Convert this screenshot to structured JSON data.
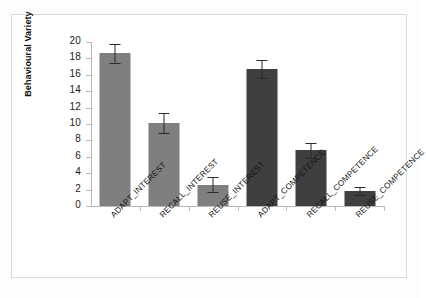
{
  "chart_data": {
    "type": "bar",
    "title": "",
    "xlabel": "",
    "ylabel": "Behavioural Variety",
    "ylim": [
      0,
      20
    ],
    "yticks": [
      0,
      2,
      4,
      6,
      8,
      10,
      12,
      14,
      16,
      18,
      20
    ],
    "grid": false,
    "legend": "none",
    "categories": [
      "ADAPT_INTEREST",
      "RECALL_INTEREST",
      "REUSE_INTEREST",
      "ADAPT_COMPETENCE",
      "RECALL_COMPETENCE",
      "REUSE_COMPETENCE"
    ],
    "values": [
      18.6,
      10.1,
      2.6,
      16.7,
      6.8,
      1.8
    ],
    "errors": [
      1.2,
      1.2,
      0.9,
      1.1,
      0.9,
      0.5
    ],
    "bar_colors": [
      "#7f7f7f",
      "#7f7f7f",
      "#7f7f7f",
      "#3f3f3f",
      "#3f3f3f",
      "#3f3f3f"
    ],
    "error_bar_color": "#2b2b2b"
  },
  "axis": {
    "tick_labels": [
      "20",
      "18",
      "16",
      "14",
      "12",
      "10",
      "8",
      "6",
      "4",
      "2",
      "0"
    ]
  }
}
